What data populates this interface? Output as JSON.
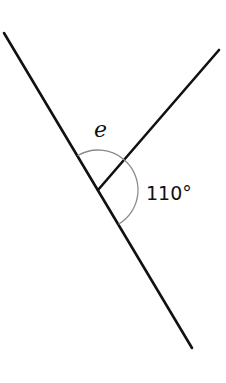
{
  "diagram": {
    "type": "intersecting-lines-angle",
    "labels": {
      "unknown_angle": "e",
      "given_angle": "110°"
    },
    "colors": {
      "lines": "#111111",
      "arcs": "#8a8a8a",
      "background": "#ffffff"
    }
  }
}
